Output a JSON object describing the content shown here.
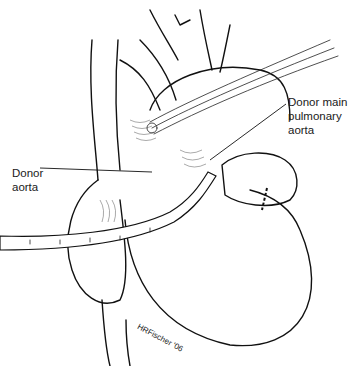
{
  "figure": {
    "type": "surgical-illustration",
    "labels": {
      "donor_aorta": [
        "Donor",
        "aorta"
      ],
      "donor_main_pulmonary_aorta": [
        "Donor main",
        "pulmonary",
        "aorta"
      ]
    },
    "signature": "HRFischer '06",
    "colors": {
      "ink": "#111111",
      "background": "#ffffff"
    }
  }
}
